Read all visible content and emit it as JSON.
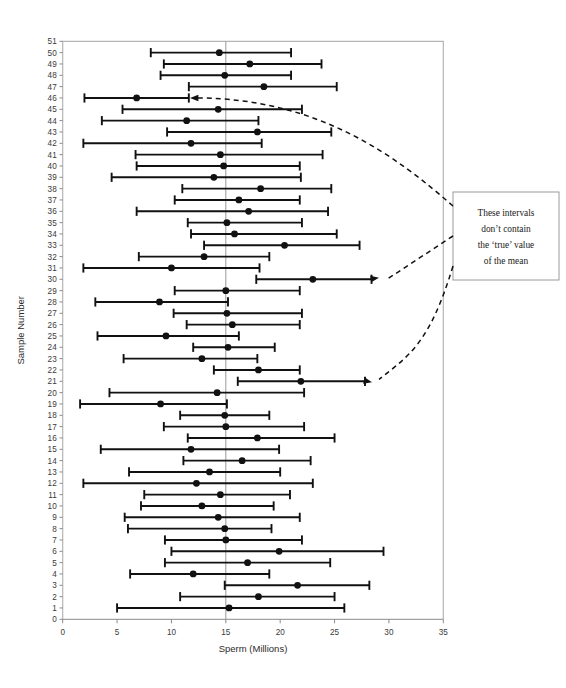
{
  "chart_data": {
    "type": "scatter",
    "title": "",
    "xlabel": "Sperm (Millions)",
    "ylabel": "Sample Number",
    "xlim": [
      0,
      35
    ],
    "ylim": [
      0,
      51
    ],
    "xticks": [
      0,
      5,
      10,
      15,
      20,
      25,
      30,
      35
    ],
    "yticks": [
      0,
      1,
      2,
      3,
      4,
      5,
      6,
      7,
      8,
      9,
      10,
      11,
      12,
      13,
      14,
      15,
      16,
      17,
      18,
      19,
      20,
      21,
      22,
      23,
      24,
      25,
      26,
      27,
      28,
      29,
      30,
      31,
      32,
      33,
      34,
      35,
      36,
      37,
      38,
      39,
      40,
      41,
      42,
      43,
      44,
      45,
      46,
      47,
      48,
      49,
      50,
      51
    ],
    "grid": false,
    "legend": "none",
    "reference_line": {
      "x": 15.0,
      "label": "true mean"
    },
    "series_description": "95% confidence intervals for the mean of 50 samples, with sample mean shown as a filled dot",
    "columns": [
      "sample",
      "lower",
      "mean",
      "upper"
    ],
    "intervals": [
      {
        "sample": 50,
        "lower": 8.1,
        "mean": 14.4,
        "upper": 21.0
      },
      {
        "sample": 49,
        "lower": 9.3,
        "mean": 17.2,
        "upper": 23.8
      },
      {
        "sample": 48,
        "lower": 9.0,
        "mean": 14.9,
        "upper": 21.0
      },
      {
        "sample": 47,
        "lower": 11.6,
        "mean": 18.5,
        "upper": 25.2
      },
      {
        "sample": 46,
        "lower": 2.0,
        "mean": 6.8,
        "upper": 11.6
      },
      {
        "sample": 45,
        "lower": 5.5,
        "mean": 14.3,
        "upper": 22.0
      },
      {
        "sample": 44,
        "lower": 3.6,
        "mean": 11.4,
        "upper": 18.0
      },
      {
        "sample": 43,
        "lower": 9.6,
        "mean": 17.9,
        "upper": 24.7
      },
      {
        "sample": 42,
        "lower": 1.9,
        "mean": 11.8,
        "upper": 18.3
      },
      {
        "sample": 41,
        "lower": 6.7,
        "mean": 14.5,
        "upper": 23.9
      },
      {
        "sample": 40,
        "lower": 6.8,
        "mean": 14.8,
        "upper": 21.8
      },
      {
        "sample": 39,
        "lower": 4.5,
        "mean": 13.9,
        "upper": 21.9
      },
      {
        "sample": 38,
        "lower": 11.0,
        "mean": 18.2,
        "upper": 24.7
      },
      {
        "sample": 37,
        "lower": 10.3,
        "mean": 16.2,
        "upper": 21.8
      },
      {
        "sample": 36,
        "lower": 6.8,
        "mean": 17.1,
        "upper": 24.4
      },
      {
        "sample": 35,
        "lower": 11.5,
        "mean": 15.1,
        "upper": 22.0
      },
      {
        "sample": 34,
        "lower": 11.8,
        "mean": 15.8,
        "upper": 25.2
      },
      {
        "sample": 33,
        "lower": 13.0,
        "mean": 20.4,
        "upper": 27.3
      },
      {
        "sample": 32,
        "lower": 7.0,
        "mean": 13.0,
        "upper": 19.0
      },
      {
        "sample": 31,
        "lower": 1.9,
        "mean": 10.0,
        "upper": 18.1
      },
      {
        "sample": 30,
        "lower": 17.8,
        "mean": 23.0,
        "upper": 28.4
      },
      {
        "sample": 29,
        "lower": 10.3,
        "mean": 15.0,
        "upper": 21.8
      },
      {
        "sample": 28,
        "lower": 3.0,
        "mean": 8.9,
        "upper": 15.2
      },
      {
        "sample": 27,
        "lower": 10.2,
        "mean": 15.1,
        "upper": 22.0
      },
      {
        "sample": 26,
        "lower": 11.4,
        "mean": 15.6,
        "upper": 21.8
      },
      {
        "sample": 25,
        "lower": 3.2,
        "mean": 9.5,
        "upper": 16.2
      },
      {
        "sample": 24,
        "lower": 12.0,
        "mean": 15.2,
        "upper": 19.5
      },
      {
        "sample": 23,
        "lower": 5.6,
        "mean": 12.8,
        "upper": 17.9
      },
      {
        "sample": 22,
        "lower": 13.9,
        "mean": 18.0,
        "upper": 21.8
      },
      {
        "sample": 21,
        "lower": 16.1,
        "mean": 21.9,
        "upper": 27.8
      },
      {
        "sample": 20,
        "lower": 4.3,
        "mean": 14.2,
        "upper": 22.2
      },
      {
        "sample": 19,
        "lower": 1.6,
        "mean": 9.0,
        "upper": 15.1
      },
      {
        "sample": 18,
        "lower": 10.8,
        "mean": 14.9,
        "upper": 19.0
      },
      {
        "sample": 17,
        "lower": 9.3,
        "mean": 15.0,
        "upper": 22.2
      },
      {
        "sample": 16,
        "lower": 11.5,
        "mean": 17.9,
        "upper": 25.0
      },
      {
        "sample": 15,
        "lower": 3.5,
        "mean": 11.8,
        "upper": 19.9
      },
      {
        "sample": 14,
        "lower": 11.1,
        "mean": 16.5,
        "upper": 22.8
      },
      {
        "sample": 13,
        "lower": 6.1,
        "mean": 13.5,
        "upper": 20.0
      },
      {
        "sample": 12,
        "lower": 1.9,
        "mean": 12.3,
        "upper": 23.0
      },
      {
        "sample": 11,
        "lower": 7.5,
        "mean": 14.5,
        "upper": 20.9
      },
      {
        "sample": 10,
        "lower": 7.2,
        "mean": 12.8,
        "upper": 19.4
      },
      {
        "sample": 9,
        "lower": 5.7,
        "mean": 14.3,
        "upper": 21.8
      },
      {
        "sample": 8,
        "lower": 6.0,
        "mean": 14.9,
        "upper": 19.2
      },
      {
        "sample": 7,
        "lower": 9.4,
        "mean": 15.0,
        "upper": 22.0
      },
      {
        "sample": 6,
        "lower": 10.0,
        "mean": 19.9,
        "upper": 29.5
      },
      {
        "sample": 5,
        "lower": 9.4,
        "mean": 17.0,
        "upper": 24.6
      },
      {
        "sample": 4,
        "lower": 6.2,
        "mean": 12.0,
        "upper": 19.0
      },
      {
        "sample": 3,
        "lower": 14.9,
        "mean": 21.6,
        "upper": 28.2
      },
      {
        "sample": 2,
        "lower": 10.8,
        "mean": 18.0,
        "upper": 25.0
      },
      {
        "sample": 1,
        "lower": 5.0,
        "mean": 15.3,
        "upper": 25.9
      }
    ],
    "annotation": {
      "lines": [
        "These intervals",
        "don’t contain",
        "the ‘true’ value",
        "of the mean"
      ],
      "points_to_samples": [
        46,
        30,
        21
      ]
    }
  }
}
